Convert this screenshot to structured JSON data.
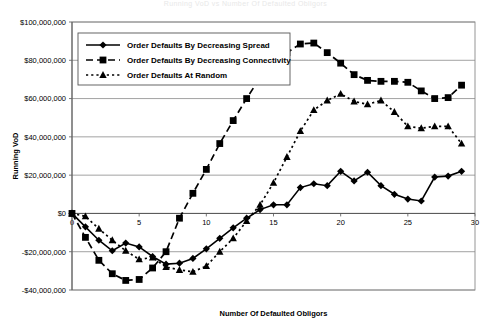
{
  "faint_title": "Running VoD vs Number Of Defaulted Obligors",
  "chart_data": {
    "type": "line",
    "title": "",
    "xlabel": "Number Of Defaulted Obligors",
    "ylabel": "Running VoD",
    "xlim": [
      0,
      30
    ],
    "ylim": [
      -40000000,
      100000000
    ],
    "grid": true,
    "legend_position": "top-left-inside",
    "x_ticks": [
      0,
      5,
      10,
      15,
      20,
      25,
      30
    ],
    "x_tick_labels": [
      "0",
      "5",
      "10",
      "15",
      "20",
      "25",
      "30"
    ],
    "y_ticks": [
      -40000000,
      -20000000,
      0,
      20000000,
      40000000,
      60000000,
      80000000,
      100000000
    ],
    "y_tick_labels": [
      "-$40,000,000",
      "-$20,000,000",
      "$0",
      "$20,000,000",
      "$40,000,000",
      "$60,000,000",
      "$80,000,000",
      "$100,000,000"
    ],
    "x": [
      0,
      1,
      2,
      3,
      4,
      5,
      6,
      7,
      8,
      9,
      10,
      11,
      12,
      13,
      14,
      15,
      16,
      17,
      18,
      19,
      20,
      21,
      22,
      23,
      24,
      25,
      26,
      27,
      28,
      29
    ],
    "series": [
      {
        "name": "Order Defaults By Decreasing Spread",
        "marker": "diamond",
        "linestyle": "solid",
        "color": "#000000",
        "values": [
          0,
          -7000000,
          -14000000,
          -19500000,
          -15500000,
          -17500000,
          -22500000,
          -26500000,
          -26000000,
          -23500000,
          -18500000,
          -13000000,
          -7500000,
          -2500000,
          2000000,
          4500000,
          4500000,
          13500000,
          15500000,
          14500000,
          22000000,
          17000000,
          21500000,
          14500000,
          10000000,
          7500000,
          6500000,
          19000000,
          19500000,
          22000000
        ]
      },
      {
        "name": "Order Defaults By Decreasing Connectivity",
        "marker": "square",
        "linestyle": "dashed",
        "color": "#000000",
        "values": [
          0,
          -12500000,
          -24500000,
          -31500000,
          -35000000,
          -34500000,
          -28500000,
          -20000000,
          -2500000,
          10500000,
          23000000,
          36500000,
          48500000,
          60000000,
          71000000,
          79500000,
          84000000,
          88500000,
          89000000,
          84000000,
          78500000,
          72500000,
          69500000,
          69000000,
          69000000,
          68500000,
          64000000,
          60000000,
          60500000,
          67000000
        ]
      },
      {
        "name": "Order Defaults At Random",
        "marker": "triangle",
        "linestyle": "dotted",
        "color": "#000000",
        "values": [
          0,
          -1500000,
          -8000000,
          -14000000,
          -19500000,
          -24000000,
          -23000000,
          -28000000,
          -29500000,
          -30500000,
          -27500000,
          -20000000,
          -13000000,
          -4000000,
          4500000,
          16000000,
          29500000,
          43000000,
          54000000,
          59000000,
          62500000,
          58500000,
          57000000,
          59000000,
          53000000,
          45500000,
          44500000,
          45500000,
          45500000,
          36500000
        ]
      }
    ]
  }
}
